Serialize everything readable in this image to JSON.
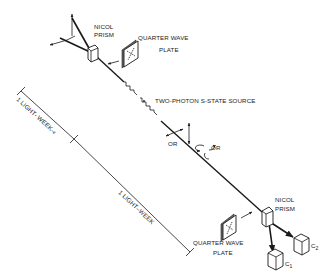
{
  "diagram": {
    "title": "",
    "labels": {
      "nicol_prism_top_line1": "NICOL",
      "nicol_prism_top_line2": "PRISM",
      "quarter_wave_top_line1": "QUARTER WAVE",
      "quarter_wave_top_line2": "PLATE",
      "source": "TWO-PHOTON S-STATE SOURCE",
      "or_linear": "OR",
      "or_circular": "OR",
      "nicol_prism_bottom_line1": "NICOL",
      "nicol_prism_bottom_line2": "PRISM",
      "quarter_wave_bottom_line1": "QUARTER WAVE",
      "quarter_wave_bottom_line2": "PLATE",
      "counter1_main": "C",
      "counter1_sub": "1",
      "counter2_main": "C",
      "counter2_sub": "2",
      "distance_short": "1 LIGHT- WEEK",
      "distance_short_suffix": "–ε",
      "distance_long": "1 LIGHT–WEEK"
    },
    "colors": {
      "ink": "#1a1a1a",
      "background": "#ffffff",
      "plate_shade": "#6a6a6a"
    }
  }
}
